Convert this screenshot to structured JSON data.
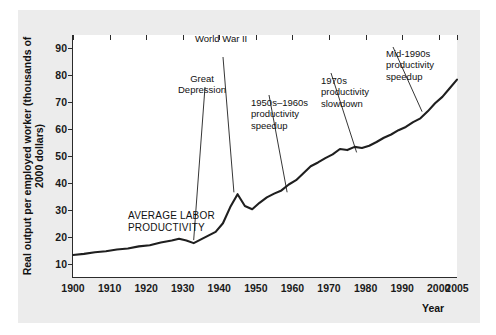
{
  "chart_data": {
    "type": "line",
    "title": "",
    "xlabel": "Year",
    "ylabel": "Real output per employed worker\n(thousands of 2000 dollars)",
    "xlim": [
      1900,
      2005
    ],
    "ylim": [
      5,
      95
    ],
    "grid": false,
    "legend": "none",
    "series_name": "AVERAGE LABOR PRODUCTIVITY",
    "line_color": "#1f1f1f",
    "xticks": [
      "1900",
      "1910",
      "1920",
      "1930",
      "1940",
      "1950",
      "1960",
      "1970",
      "1980",
      "1990",
      "2000",
      "2005"
    ],
    "xtick_values": [
      1900,
      1910,
      1920,
      1930,
      1940,
      1950,
      1960,
      1970,
      1980,
      1990,
      2000,
      2005
    ],
    "yticks": [
      "10",
      "20",
      "30",
      "40",
      "50",
      "60",
      "70",
      "80",
      "90"
    ],
    "ytick_values": [
      10,
      20,
      30,
      40,
      50,
      60,
      70,
      80,
      90
    ],
    "x": [
      1900,
      1903,
      1906,
      1909,
      1912,
      1915,
      1918,
      1921,
      1924,
      1927,
      1929,
      1931,
      1933,
      1935,
      1937,
      1939,
      1941,
      1943,
      1945,
      1947,
      1949,
      1951,
      1953,
      1955,
      1957,
      1959,
      1961,
      1963,
      1965,
      1967,
      1969,
      1971,
      1973,
      1975,
      1977,
      1979,
      1981,
      1983,
      1985,
      1987,
      1989,
      1991,
      1993,
      1995,
      1997,
      1999,
      2001,
      2003,
      2005
    ],
    "y": [
      13.2,
      13.6,
      14.2,
      14.6,
      15.2,
      15.6,
      16.4,
      16.8,
      17.8,
      18.6,
      19.2,
      18.6,
      17.6,
      19.0,
      20.4,
      21.8,
      25.0,
      31.0,
      35.8,
      31.4,
      30.2,
      32.6,
      34.6,
      36.0,
      37.2,
      39.4,
      41.0,
      43.6,
      46.2,
      47.6,
      49.2,
      50.6,
      52.6,
      52.2,
      53.4,
      53.0,
      53.8,
      55.2,
      56.8,
      58.0,
      59.6,
      60.8,
      62.6,
      64.0,
      66.6,
      69.6,
      72.0,
      75.2,
      78.4
    ],
    "annotations": [
      {
        "text": "Great\nDepression",
        "point_year": 1933,
        "point_value": 17.6
      },
      {
        "text": "World War II",
        "point_year": 1944,
        "point_value": 35.0
      },
      {
        "text": "1950s–1960s\nproductivity\nspeedup",
        "point_year": 1958,
        "point_value": 38.0
      },
      {
        "text": "1970s\nproductivity\nslowdown",
        "point_year": 1977,
        "point_value": 53.2
      },
      {
        "text": "Mid-1990s\nproductivity\nspeedup",
        "point_year": 1996,
        "point_value": 65.0
      },
      {
        "text": "AVERAGE LABOR\nPRODUCTIVITY",
        "point_year": 1915,
        "point_value": 15.6
      }
    ]
  }
}
